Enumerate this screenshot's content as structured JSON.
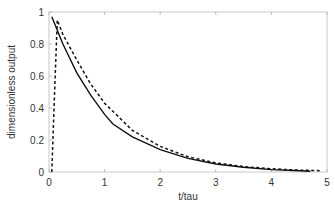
{
  "chart_data": {
    "type": "line",
    "title": "",
    "xlabel": "t/tau",
    "ylabel": "dimensionless output",
    "xlim": [
      0,
      5
    ],
    "ylim": [
      0,
      1
    ],
    "xticks": [
      "0",
      "1",
      "2",
      "3",
      "4",
      "5"
    ],
    "yticks": [
      "0",
      "0.2",
      "0.4",
      "0.6",
      "0.8",
      "1"
    ],
    "grid": false,
    "legend": null,
    "series": [
      {
        "name": "solid",
        "style": "solid",
        "x": [
          0.05,
          0.25,
          0.5,
          0.75,
          1.0,
          1.15,
          1.5,
          2.0,
          2.5,
          3.0,
          3.5,
          4.0,
          4.5,
          4.7
        ],
        "y": [
          0.97,
          0.8,
          0.62,
          0.48,
          0.36,
          0.3,
          0.22,
          0.14,
          0.085,
          0.05,
          0.03,
          0.015,
          0.008,
          0.005
        ]
      },
      {
        "name": "dashed",
        "style": "dashed",
        "x": [
          0.05,
          0.1,
          0.15,
          0.25,
          0.5,
          0.75,
          1.0,
          1.5,
          2.0,
          2.5,
          3.0,
          3.5,
          4.0,
          4.5,
          4.9
        ],
        "y": [
          0.0,
          0.5,
          0.95,
          0.86,
          0.7,
          0.55,
          0.43,
          0.26,
          0.16,
          0.095,
          0.057,
          0.034,
          0.02,
          0.012,
          0.008
        ]
      }
    ]
  }
}
